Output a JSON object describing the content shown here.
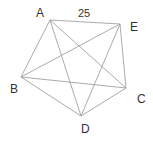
{
  "diagram": {
    "type": "complete-graph-pentagon",
    "vertices": [
      {
        "id": "A",
        "label": "A",
        "x": 50,
        "y": 20,
        "lx": 36,
        "ly": 17
      },
      {
        "id": "E",
        "label": "E",
        "x": 120,
        "y": 24,
        "lx": 130,
        "ly": 31
      },
      {
        "id": "C",
        "label": "C",
        "x": 126,
        "y": 88,
        "lx": 137,
        "ly": 103
      },
      {
        "id": "D",
        "label": "D",
        "x": 81,
        "y": 116,
        "lx": 81,
        "ly": 133
      },
      {
        "id": "B",
        "label": "B",
        "x": 21,
        "y": 77,
        "lx": 10,
        "ly": 93
      }
    ],
    "edges": [
      [
        "A",
        "E"
      ],
      [
        "A",
        "B"
      ],
      [
        "A",
        "C"
      ],
      [
        "A",
        "D"
      ],
      [
        "E",
        "B"
      ],
      [
        "E",
        "C"
      ],
      [
        "E",
        "D"
      ],
      [
        "B",
        "C"
      ],
      [
        "B",
        "D"
      ],
      [
        "C",
        "D"
      ]
    ],
    "edge_labels": [
      {
        "edge": [
          "A",
          "E"
        ],
        "text": "25",
        "x": 78,
        "y": 17
      }
    ],
    "colors": {
      "edge": "#a0a0a0",
      "label": "#333333"
    }
  }
}
